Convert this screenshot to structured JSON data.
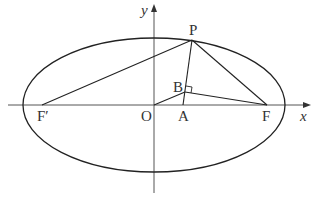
{
  "diagram": {
    "type": "ellipse-foci-geometry",
    "labels": {
      "y_axis": "y",
      "x_axis": "x",
      "origin": "O",
      "point_P": "P",
      "point_B": "B",
      "point_A": "A",
      "focus_F": "F",
      "focus_F_prime": "F′"
    },
    "points": {
      "O": [
        154,
        105
      ],
      "P": [
        192,
        40
      ],
      "F": [
        267,
        105
      ],
      "F_prime": [
        42,
        105
      ],
      "A": [
        183,
        105
      ],
      "B": [
        185,
        92
      ]
    },
    "ellipse": {
      "cx": 154,
      "cy": 105,
      "rx": 131,
      "ry": 67
    },
    "segments": [
      "F'P",
      "PF",
      "PA",
      "OB",
      "BF"
    ],
    "right_angle_at": "B",
    "colors": {
      "stroke": "#222222",
      "axis": "#555555",
      "text": "#333333"
    }
  }
}
